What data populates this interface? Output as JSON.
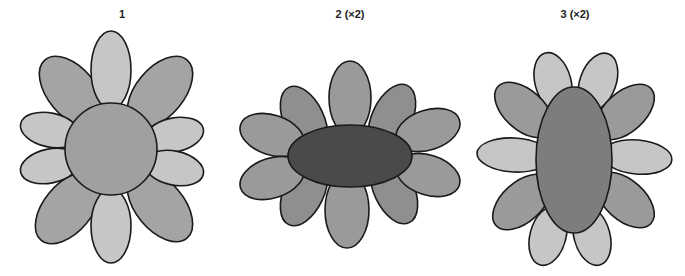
{
  "figures": [
    {
      "label": "1",
      "x": 122
    },
    {
      "label": "2 (×2)",
      "x": 350
    },
    {
      "label": "3 (×2)",
      "x": 575
    }
  ],
  "colors": {
    "petal_light": "#c6c6c6",
    "petal_mid": "#a4a4a4",
    "petal_mid2": "#8f8f8f",
    "center_1": "#a0a0a0",
    "center_2": "#4a4a4a",
    "center_3": "#7d7d7d",
    "outline": "#1a1a1a"
  }
}
